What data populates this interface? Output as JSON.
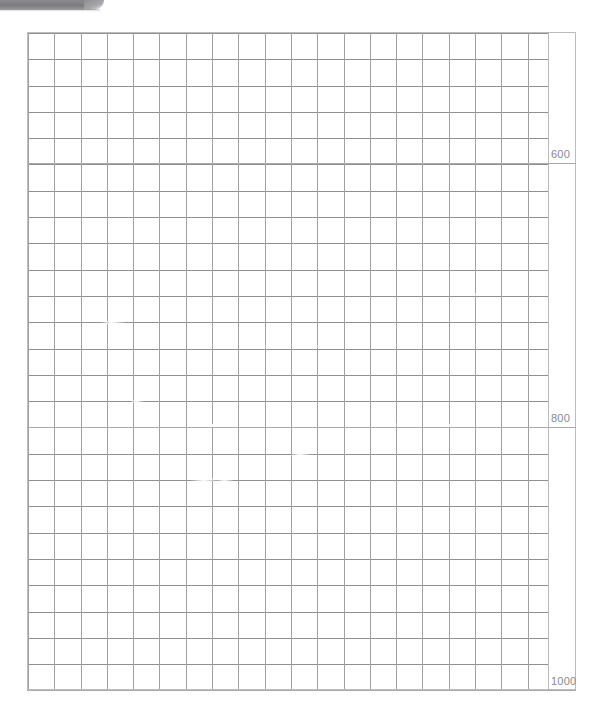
{
  "page": {
    "width": 602,
    "height": 728,
    "background": "#ffffff"
  },
  "header_bar": {
    "name": "gray-header-bar",
    "color": "#7c7c80"
  },
  "chart_data": {
    "type": "table",
    "title": "",
    "subtitle": "",
    "xlabel": "",
    "ylabel": "",
    "grid": true,
    "legend": "none",
    "columns": 20,
    "rows": 25,
    "cell_size_px": 26.3,
    "categories": [],
    "values": [],
    "axis": {
      "position": "right",
      "tick_labels": [
        "600",
        "800",
        "1000"
      ],
      "tick_values": [
        600,
        800,
        1000
      ],
      "tick_y_px": [
        156,
        420,
        683
      ],
      "range": [
        600,
        1000
      ],
      "interval": 200
    }
  },
  "ticks": [
    {
      "label": "600",
      "y": 149
    },
    {
      "label": "800",
      "y": 413
    },
    {
      "label": "1000",
      "y": 676
    }
  ],
  "tick_rules": [
    {
      "y": 163
    },
    {
      "y": 427
    },
    {
      "y": 690
    }
  ],
  "artifacts": [
    {
      "x": 100,
      "y": 321,
      "w": 26
    },
    {
      "x": 240,
      "y": 345,
      "w": 30
    },
    {
      "x": 296,
      "y": 345,
      "w": 26
    },
    {
      "x": 320,
      "y": 346,
      "w": 22
    },
    {
      "x": 196,
      "y": 424,
      "w": 34
    },
    {
      "x": 376,
      "y": 423,
      "w": 24
    },
    {
      "x": 396,
      "y": 424,
      "w": 18
    },
    {
      "x": 462,
      "y": 293,
      "w": 20
    },
    {
      "x": 290,
      "y": 454,
      "w": 22
    },
    {
      "x": 190,
      "y": 478,
      "w": 30
    },
    {
      "x": 216,
      "y": 479,
      "w": 18
    },
    {
      "x": 440,
      "y": 424,
      "w": 16
    },
    {
      "x": 130,
      "y": 400,
      "w": 14
    }
  ]
}
